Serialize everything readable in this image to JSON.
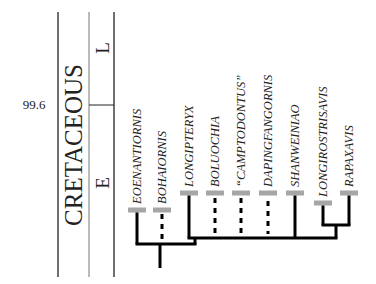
{
  "timescale": {
    "age_label": "99.6",
    "period": "CRETACEOUS",
    "epochs": [
      "L",
      "E"
    ]
  },
  "taxa": [
    {
      "name": "EOENANTIORNIS",
      "line": "solid"
    },
    {
      "name": "BOHAIORNIS",
      "line": "dotted"
    },
    {
      "name": "LONGIPTERYX",
      "line": "solid"
    },
    {
      "name": "BOLUOCHIA",
      "line": "dotted"
    },
    {
      "name": "“CAMPTODONTUS”",
      "line": "dotted"
    },
    {
      "name": "DAPINGFANGORNIS",
      "line": "dotted"
    },
    {
      "name": "SHANWEINIAO",
      "line": "solid"
    },
    {
      "name": "LONGIROSTRISAVIS",
      "line": "solid"
    },
    {
      "name": "RAPAXAVIS",
      "line": "solid"
    }
  ],
  "colors": {
    "range_bar": "#a6a6a6",
    "tree": "#000000",
    "column_line": "#222222",
    "column_line_light": "#777777"
  }
}
